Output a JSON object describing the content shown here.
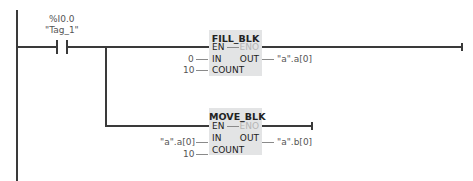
{
  "contact": {
    "address": "%I0.0",
    "tag": "\"Tag_1\""
  },
  "blocks": [
    {
      "title": "FILL_BLK",
      "pins_in": [
        "EN",
        "IN",
        "COUNT"
      ],
      "pins_out": [
        "ENO",
        "OUT"
      ],
      "in_values": {
        "IN": "0",
        "COUNT": "10"
      },
      "out_values": {
        "OUT": "\"a\".a[0]"
      }
    },
    {
      "title": "MOVE_BLK",
      "pins_in": [
        "EN",
        "IN",
        "COUNT"
      ],
      "pins_out": [
        "ENO",
        "OUT"
      ],
      "in_values": {
        "IN": "\"a\".a[0]",
        "COUNT": "10"
      },
      "out_values": {
        "OUT": "\"a\".b[0]"
      }
    }
  ],
  "colors": {
    "wire": "#3a3a3a",
    "block_fill": "#e3e4e5",
    "eno_disabled": "#b5b5b5"
  }
}
